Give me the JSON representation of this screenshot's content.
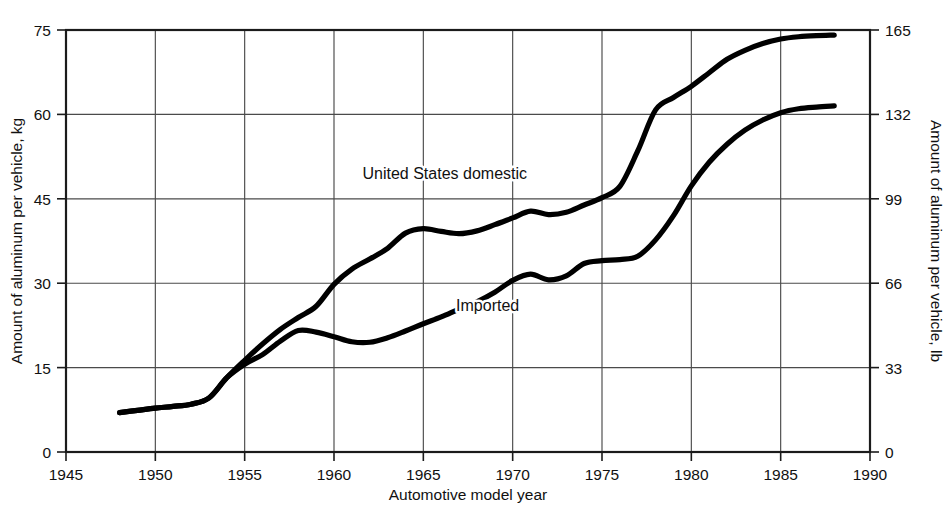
{
  "chart_data": {
    "type": "line",
    "title": "",
    "xlabel": "Automotive model year",
    "ylabel": "Amount of aluminum per vehicle, kg",
    "ylabel_right": "Amount of aluminum per vehicle, lb",
    "xlim": [
      1945,
      1990
    ],
    "ylim": [
      0,
      75
    ],
    "ylim_right": [
      0,
      165
    ],
    "xticks": [
      1945,
      1950,
      1955,
      1960,
      1965,
      1970,
      1975,
      1980,
      1985,
      1990
    ],
    "xtick_labels": [
      "1945",
      "1950",
      "1955",
      "1960",
      "1965",
      "1970",
      "1975",
      "1980",
      "1985",
      "1990"
    ],
    "yticks": [
      0,
      15,
      30,
      45,
      60,
      75
    ],
    "ytick_labels": [
      "0",
      "15",
      "30",
      "45",
      "60",
      "75"
    ],
    "yticks_right": [
      0,
      33,
      66,
      99,
      132,
      165
    ],
    "ytick_labels_right": [
      "0",
      "33",
      "66",
      "99",
      "132",
      "165"
    ],
    "grid": true,
    "legend": "inline-annotations",
    "line_color": "#000000",
    "series": [
      {
        "name": "United States domestic",
        "label": "United States domestic",
        "label_x": 1966.2,
        "label_y": 48.5,
        "x": [
          1948,
          1949,
          1950,
          1951,
          1952,
          1953,
          1954,
          1955,
          1956,
          1957,
          1958,
          1959,
          1960,
          1961,
          1962,
          1963,
          1964,
          1965,
          1966,
          1967,
          1968,
          1969,
          1970,
          1971,
          1972,
          1973,
          1974,
          1975,
          1976,
          1977,
          1978,
          1979,
          1980,
          1981,
          1982,
          1983,
          1984,
          1985,
          1986,
          1987,
          1988
        ],
        "y": [
          7.0,
          7.4,
          7.8,
          8.1,
          8.5,
          9.6,
          13.2,
          16.3,
          19.2,
          21.8,
          23.9,
          25.9,
          29.8,
          32.5,
          34.3,
          36.2,
          38.9,
          39.7,
          39.2,
          38.8,
          39.3,
          40.4,
          41.6,
          42.8,
          42.2,
          42.6,
          43.9,
          45.2,
          47.2,
          53.5,
          60.8,
          63.0,
          65.0,
          67.4,
          69.8,
          71.4,
          72.6,
          73.4,
          73.8,
          74.0,
          74.1
        ]
      },
      {
        "name": "Imported",
        "label": "Imported",
        "label_x": 1968.6,
        "label_y": 25.0,
        "x": [
          1948,
          1949,
          1950,
          1951,
          1952,
          1953,
          1954,
          1955,
          1956,
          1957,
          1958,
          1959,
          1960,
          1961,
          1962,
          1963,
          1964,
          1965,
          1966,
          1967,
          1968,
          1969,
          1970,
          1971,
          1972,
          1973,
          1974,
          1975,
          1976,
          1977,
          1978,
          1979,
          1980,
          1981,
          1982,
          1983,
          1984,
          1985,
          1986,
          1987,
          1988
        ],
        "y": [
          7.0,
          7.4,
          7.8,
          8.1,
          8.5,
          9.6,
          13.2,
          15.6,
          17.3,
          19.7,
          21.6,
          21.3,
          20.5,
          19.6,
          19.5,
          20.3,
          21.5,
          22.8,
          24.0,
          25.4,
          26.7,
          28.4,
          30.5,
          31.6,
          30.6,
          31.3,
          33.5,
          34.0,
          34.2,
          34.8,
          37.7,
          42.0,
          47.3,
          51.5,
          54.7,
          57.2,
          59.0,
          60.3,
          61.0,
          61.3,
          61.5
        ]
      }
    ]
  }
}
